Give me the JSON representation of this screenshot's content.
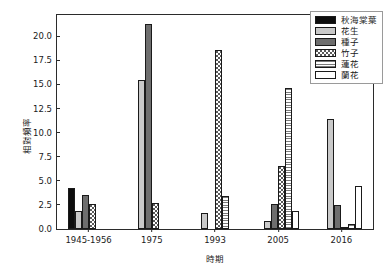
{
  "chart_data": {
    "type": "bar",
    "title": "",
    "xlabel": "時期",
    "ylabel": "相對頻率",
    "ylim": [
      0,
      22.2
    ],
    "yticks": [
      "0.0",
      "2.5",
      "5.0",
      "7.5",
      "10.0",
      "12.5",
      "15.0",
      "17.5",
      "20.0"
    ],
    "ytick_values": [
      0,
      2.5,
      5.0,
      7.5,
      10.0,
      12.5,
      15.0,
      17.5,
      20.0
    ],
    "grid": false,
    "legend_position": "upper right",
    "categories": [
      "1945-1956",
      "1975",
      "1993",
      "2005",
      "2016"
    ],
    "series": [
      {
        "name": "秋海棠葉",
        "fill": "solid-black",
        "color": "#0d0d0d",
        "values": [
          4.3,
          0,
          0,
          0,
          0
        ]
      },
      {
        "name": "花生",
        "fill": "solid-lightgray",
        "color": "#c9c9c9",
        "values": [
          1.9,
          15.5,
          1.7,
          0.85,
          11.4
        ]
      },
      {
        "name": "種子",
        "fill": "solid-darkgray",
        "color": "#6e6e6e",
        "values": [
          3.5,
          21.3,
          0,
          2.55,
          2.5
        ]
      },
      {
        "name": "竹子",
        "fill": "dotted",
        "color": "#5a5a5a",
        "values": [
          2.6,
          2.7,
          18.6,
          6.5,
          0.25
        ]
      },
      {
        "name": "蓮花",
        "fill": "horizontal-lines",
        "color": "#7a7a7a",
        "values": [
          0,
          0,
          3.4,
          14.6,
          0.5
        ]
      },
      {
        "name": "蘭花",
        "fill": "open-white",
        "color": "#ffffff",
        "values": [
          0,
          0,
          0,
          1.9,
          4.5
        ]
      }
    ]
  }
}
